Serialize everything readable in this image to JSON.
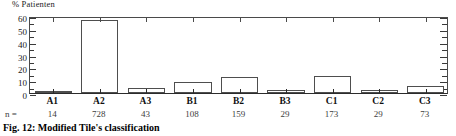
{
  "chart_data": {
    "type": "bar",
    "title": "",
    "caption": "Fig. 12: Modified Tile's classification",
    "ylabel": "% Patienten",
    "xlabel": "",
    "ylim": [
      0,
      60
    ],
    "yticks": [
      0,
      10,
      20,
      30,
      40,
      50,
      60
    ],
    "yticks_minor": [
      5,
      15,
      25,
      35,
      45,
      55
    ],
    "grid": false,
    "legend": null,
    "categories": [
      "A1",
      "A2",
      "A3",
      "B1",
      "B2",
      "B3",
      "C1",
      "C2",
      "C3"
    ],
    "values": [
      0.9,
      56.9,
      4.0,
      8.4,
      12.6,
      2.3,
      13.0,
      2.3,
      5.7
    ],
    "n_label": "n =",
    "n_values": [
      14,
      728,
      43,
      108,
      159,
      29,
      173,
      29,
      73
    ]
  },
  "figure": {
    "caption": "Fig. 12: Modified Tile's classification"
  }
}
